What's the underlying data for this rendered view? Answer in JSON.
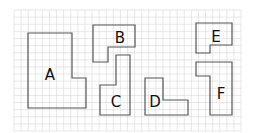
{
  "diagram": {
    "type": "grid-shapes",
    "background": "#ffffff",
    "grid": {
      "x0": 14,
      "y0": 10,
      "x1": 241,
      "y1": 131,
      "cols": 32,
      "rows": 17,
      "line_color": "#d9d9d9"
    },
    "stroke_color": "#555555",
    "shapes": [
      {
        "label": "A",
        "points": [
          [
            28,
            33
          ],
          [
            72,
            33
          ],
          [
            72,
            78
          ],
          [
            86,
            78
          ],
          [
            86,
            108
          ],
          [
            28,
            108
          ]
        ],
        "label_pos": [
          50,
          75
        ]
      },
      {
        "label": "B",
        "points": [
          [
            93,
            25
          ],
          [
            135,
            25
          ],
          [
            135,
            47
          ],
          [
            108,
            47
          ],
          [
            108,
            62
          ],
          [
            93,
            62
          ]
        ],
        "label_pos": [
          120,
          38
        ]
      },
      {
        "label": "C",
        "points": [
          [
            116,
            55
          ],
          [
            130,
            55
          ],
          [
            130,
            115
          ],
          [
            100,
            115
          ],
          [
            100,
            85
          ],
          [
            116,
            85
          ]
        ],
        "label_pos": [
          116,
          102
        ]
      },
      {
        "label": "D",
        "points": [
          [
            145,
            78
          ],
          [
            163,
            78
          ],
          [
            163,
            100
          ],
          [
            188,
            100
          ],
          [
            188,
            115
          ],
          [
            145,
            115
          ]
        ],
        "label_pos": [
          155,
          102
        ]
      },
      {
        "label": "E",
        "points": [
          [
            196,
            23
          ],
          [
            232,
            23
          ],
          [
            232,
            45
          ],
          [
            210,
            45
          ],
          [
            210,
            53
          ],
          [
            196,
            53
          ]
        ],
        "label_pos": [
          216,
          37
        ]
      },
      {
        "label": "F",
        "points": [
          [
            196,
            62
          ],
          [
            232,
            62
          ],
          [
            232,
            115
          ],
          [
            210,
            115
          ],
          [
            210,
            76
          ],
          [
            196,
            76
          ]
        ],
        "label_pos": [
          221,
          94
        ]
      }
    ]
  }
}
